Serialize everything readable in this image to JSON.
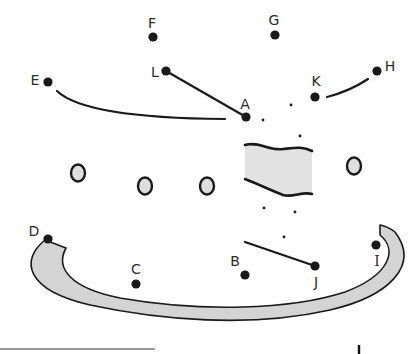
{
  "puzzle": {
    "type": "connect-the-dots",
    "top_text_cropped": "",
    "colors": {
      "ink": "#1a1a1a",
      "fill_gray": "#d4d4d4",
      "circle_fill": "#dedede",
      "label": "#2b2b2b"
    },
    "points": [
      {
        "label": "A",
        "x": 246,
        "y": 117,
        "lx": 245,
        "ly": 104
      },
      {
        "label": "B",
        "x": 245,
        "y": 275,
        "lx": 235,
        "ly": 261
      },
      {
        "label": "C",
        "x": 136,
        "y": 284,
        "lx": 136,
        "ly": 269
      },
      {
        "label": "D",
        "x": 48,
        "y": 239,
        "lx": 34,
        "ly": 231
      },
      {
        "label": "E",
        "x": 48,
        "y": 82,
        "lx": 35,
        "ly": 80
      },
      {
        "label": "F",
        "x": 153,
        "y": 37,
        "lx": 152,
        "ly": 23
      },
      {
        "label": "G",
        "x": 275,
        "y": 35,
        "lx": 274,
        "ly": 20
      },
      {
        "label": "H",
        "x": 377,
        "y": 71,
        "lx": 390,
        "ly": 66
      },
      {
        "label": "I",
        "x": 376,
        "y": 245,
        "lx": 377,
        "ly": 261
      },
      {
        "label": "J",
        "x": 315,
        "y": 266,
        "lx": 316,
        "ly": 282
      },
      {
        "label": "K",
        "x": 315,
        "y": 97,
        "lx": 316,
        "ly": 81
      },
      {
        "label": "L",
        "x": 166,
        "y": 71,
        "lx": 155,
        "ly": 72
      }
    ],
    "small_dots": [
      {
        "x": 263,
        "y": 120
      },
      {
        "x": 291,
        "y": 105
      },
      {
        "x": 300,
        "y": 136
      },
      {
        "x": 264,
        "y": 208
      },
      {
        "x": 295,
        "y": 212
      },
      {
        "x": 284,
        "y": 237
      }
    ],
    "segments": [
      {
        "from": "L",
        "to": "A",
        "d": "M166,71 L246,117"
      },
      {
        "from": "E",
        "to": "A",
        "d": "M57,91 Q85,118 225,119"
      },
      {
        "from": "K",
        "to": "H",
        "d": "M327,97 Q350,91 368,79"
      },
      {
        "from": "B",
        "to": "J",
        "d": "M245,242 L315,266"
      }
    ],
    "ovals": [
      {
        "cx": 78,
        "cy": 173,
        "rx": 7,
        "ry": 8.5
      },
      {
        "cx": 145,
        "cy": 186,
        "rx": 7,
        "ry": 8.5
      },
      {
        "cx": 207,
        "cy": 186,
        "rx": 7,
        "ry": 8.5
      },
      {
        "cx": 354,
        "cy": 166,
        "rx": 7,
        "ry": 8.5
      }
    ],
    "wavy_rect": {
      "d": "M245,145 C258,141 270,151 283,149 C293,148 303,146 312,151 L312,194 C302,191 293,198 283,195 C270,190 258,184 245,179 Z",
      "top_edge": "M245,145 C258,141 270,151 283,149 C293,148 303,146 312,151",
      "bottom_edge": "M245,179 C258,184 270,190 283,195 C293,198 302,191 312,194"
    },
    "arc_band": {
      "d": "M45,240 C20,260 25,290 90,305 C160,320 250,328 330,310 C390,296 420,265 395,232 C390,228 385,226 380,225 L380,235 C398,250 390,275 345,292 C290,310 200,312 120,298 C70,288 55,268 66,248 Z"
    },
    "bottom_line": {
      "x1": 0,
      "y1": 349,
      "x2": 155,
      "y2": 349
    },
    "bottom_mark": {
      "x": 359,
      "y1": 345,
      "y2": 354
    }
  }
}
